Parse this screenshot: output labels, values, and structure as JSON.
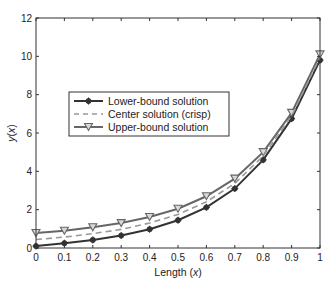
{
  "chart_data": {
    "type": "line",
    "title": "",
    "xlabel": "Length (x)",
    "ylabel": "y(x)",
    "xlim": [
      0,
      1
    ],
    "ylim": [
      0,
      12
    ],
    "grid": false,
    "legend_position": "inside-center-left",
    "x": [
      0,
      0.1,
      0.2,
      0.3,
      0.4,
      0.5,
      0.6,
      0.7,
      0.8,
      0.9,
      1.0
    ],
    "xticks": [
      "0",
      "0.1",
      "0.2",
      "0.3",
      "0.4",
      "0.5",
      "0.6",
      "0.7",
      "0.8",
      "0.9",
      "1"
    ],
    "yticks": [
      "0",
      "2",
      "4",
      "6",
      "8",
      "10",
      "12"
    ],
    "series": [
      {
        "name": "Lower-bound solution",
        "style": "solid",
        "marker": "star-dot",
        "color": "#333333",
        "values": [
          0.1,
          0.25,
          0.42,
          0.65,
          0.98,
          1.45,
          2.12,
          3.1,
          4.6,
          6.75,
          9.8
        ]
      },
      {
        "name": "Center solution (crisp)",
        "style": "dashed",
        "marker": "none",
        "color": "#999999",
        "values": [
          0.44,
          0.57,
          0.75,
          0.97,
          1.3,
          1.75,
          2.41,
          3.37,
          4.8,
          6.9,
          9.95
        ]
      },
      {
        "name": "Upper-bound solution",
        "style": "solid",
        "marker": "triangle-down",
        "color": "#666666",
        "values": [
          0.78,
          0.9,
          1.08,
          1.3,
          1.62,
          2.05,
          2.7,
          3.62,
          5.0,
          7.05,
          10.1
        ]
      }
    ]
  },
  "labels": {
    "xlabel_prefix": "Length (",
    "xlabel_var": "x",
    "xlabel_suffix": ")",
    "ylabel_var": "y",
    "ylabel_open": "(",
    "ylabel_arg": "x",
    "ylabel_close": ")"
  }
}
